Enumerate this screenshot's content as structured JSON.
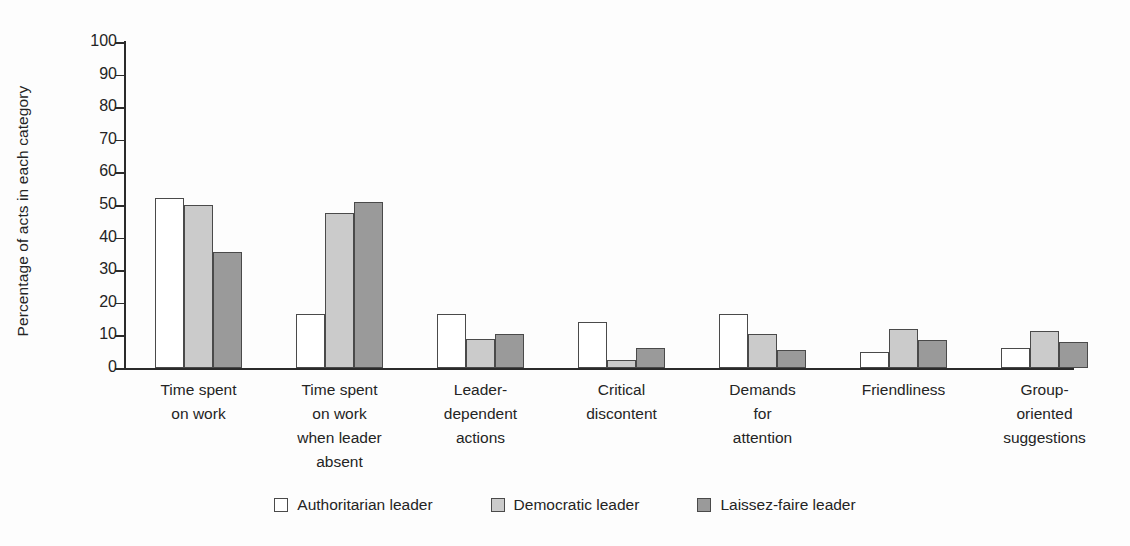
{
  "chart_data": {
    "type": "bar",
    "title": "",
    "xlabel": "",
    "ylabel": "Percentage of acts in each category",
    "ylim": [
      0,
      100
    ],
    "ytick_step": 10,
    "yticks": [
      100,
      90,
      80,
      70,
      60,
      50,
      40,
      30,
      20,
      10,
      0
    ],
    "grid": false,
    "legend_position": "bottom-center",
    "categories": [
      "Time spent\non work",
      "Time spent\non work\nwhen leader\nabsent",
      "Leader-\ndependent\nactions",
      "Critical\ndiscontent",
      "Demands\nfor\nattention",
      "Friendliness",
      "Group-\noriented\nsuggestions"
    ],
    "category_lines": [
      [
        "Time spent",
        "on work"
      ],
      [
        "Time spent",
        "on work",
        "when leader",
        "absent"
      ],
      [
        "Leader-",
        "dependent",
        "actions"
      ],
      [
        "Critical",
        "discontent"
      ],
      [
        "Demands",
        "for",
        "attention"
      ],
      [
        "Friendliness"
      ],
      [
        "Group-",
        "oriented",
        "suggestions"
      ]
    ],
    "series": [
      {
        "name": "Authoritarian leader",
        "color": "#ffffff",
        "values": [
          52,
          16.5,
          16.5,
          14,
          16.5,
          5,
          6
        ]
      },
      {
        "name": "Democratic leader",
        "color": "#cbcbcb",
        "values": [
          50,
          47.5,
          9,
          2.5,
          10.5,
          12,
          11.5
        ]
      },
      {
        "name": "Laissez-faire leader",
        "color": "#9a9a9a",
        "values": [
          35.5,
          51,
          10.5,
          6,
          5.5,
          8.5,
          8
        ]
      }
    ]
  },
  "legend": {
    "items": [
      {
        "label": "Authoritarian leader",
        "swatch": "#ffffff"
      },
      {
        "label": "Democratic leader",
        "swatch": "#cbcbcb"
      },
      {
        "label": "Laissez-faire leader",
        "swatch": "#9a9a9a"
      }
    ]
  }
}
